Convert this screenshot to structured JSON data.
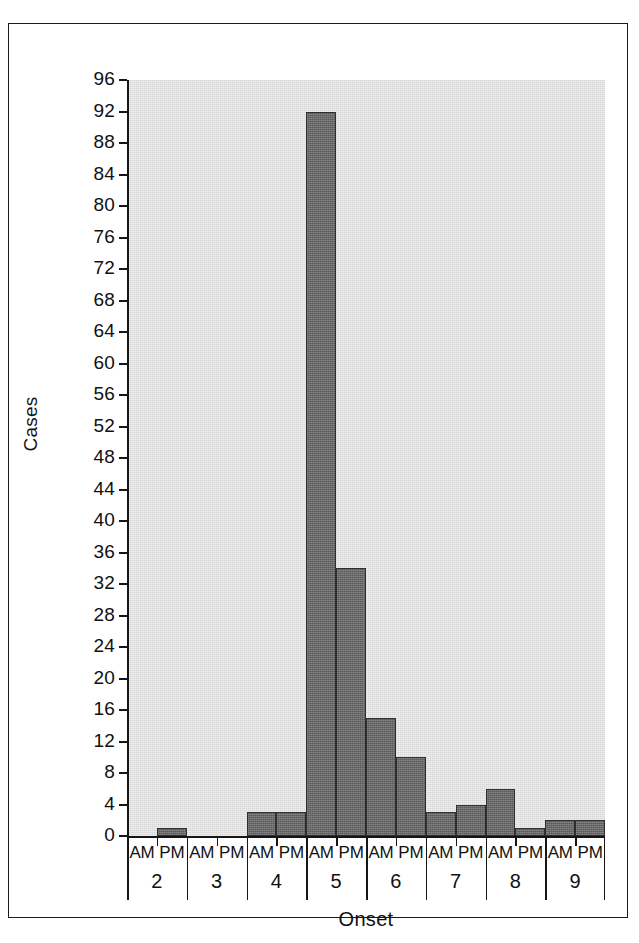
{
  "figure": {
    "y_axis_title": "Cases",
    "x_axis_title": "Onset"
  },
  "colors": {
    "plot_background": "#e0e0e0",
    "bar_fill": "#6b6b6b",
    "bar_outline": "#2e2e2e",
    "axis": "#161616",
    "page_background": "#ffffff",
    "frame": "#1a1a1a"
  },
  "chart_data": {
    "type": "bar",
    "title": "",
    "subtitle": "",
    "xlabel": "Onset",
    "ylabel": "Cases",
    "ylim": [
      0,
      96
    ],
    "ytick_step": 4,
    "yticks": [
      0,
      4,
      8,
      12,
      16,
      20,
      24,
      28,
      32,
      36,
      40,
      44,
      48,
      52,
      56,
      60,
      64,
      68,
      72,
      76,
      80,
      84,
      88,
      92,
      96
    ],
    "ytick_labels": [
      "0",
      "4",
      "8",
      "12",
      "16",
      "20",
      "24",
      "28",
      "32",
      "36",
      "40",
      "44",
      "48",
      "52",
      "56",
      "60",
      "64",
      "68",
      "72",
      "76",
      "80",
      "84",
      "88",
      "92",
      "96"
    ],
    "grid": false,
    "legend": null,
    "x_group_label": "day",
    "x_sub_labels": [
      "AM",
      "PM"
    ],
    "groups": [
      "2",
      "3",
      "4",
      "5",
      "6",
      "7",
      "8",
      "9"
    ],
    "categories": [
      "2 AM",
      "2 PM",
      "3 AM",
      "3 PM",
      "4 AM",
      "4 PM",
      "5 AM",
      "5 PM",
      "6 AM",
      "6 PM",
      "7 AM",
      "7 PM",
      "8 AM",
      "8 PM",
      "9 AM",
      "9 PM"
    ],
    "values": [
      0,
      1,
      0,
      0,
      3,
      3,
      92,
      34,
      15,
      10,
      3,
      4,
      6,
      1,
      2,
      2
    ],
    "grouped": [
      {
        "day": "2",
        "am": 0,
        "pm": 1
      },
      {
        "day": "3",
        "am": 0,
        "pm": 0
      },
      {
        "day": "4",
        "am": 3,
        "pm": 3
      },
      {
        "day": "5",
        "am": 92,
        "pm": 34
      },
      {
        "day": "6",
        "am": 15,
        "pm": 10
      },
      {
        "day": "7",
        "am": 3,
        "pm": 4
      },
      {
        "day": "8",
        "am": 6,
        "pm": 1
      },
      {
        "day": "9",
        "am": 2,
        "pm": 2
      }
    ]
  }
}
